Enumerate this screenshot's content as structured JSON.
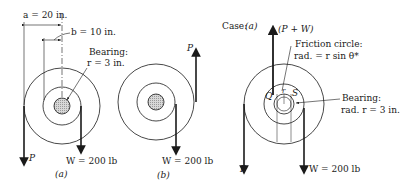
{
  "figure_a": {
    "dim_a": "a = 20 in.",
    "dim_b": "b = 10 in.",
    "bearing_title": "Bearing:",
    "bearing_r": "r = 3 in.",
    "force_p": "P",
    "force_w": "W = 200 lb",
    "caption": "(a)"
  },
  "figure_b": {
    "force_p": "P",
    "force_w": "W = 200 lb",
    "caption": "(b)"
  },
  "figure_c": {
    "case_label": "Case:",
    "case_value": "(a)",
    "resultant": "(P + W)",
    "friction_title": "Friction circle:",
    "friction_rad": "rad. = r sin θ*",
    "point_q": "Q",
    "point_s": "S",
    "point_r": "r",
    "bearing_title": "Bearing:",
    "bearing_rad": "rad. r = 3 in.",
    "force_p": "P",
    "force_w": "W = 200 lb"
  },
  "colors": {
    "line": "#1a1a1a",
    "hub_fill": "#c8c8c8"
  }
}
